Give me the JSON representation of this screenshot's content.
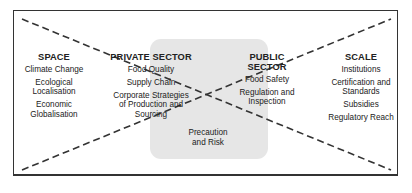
{
  "diagram": {
    "columns": [
      {
        "id": "space",
        "heading": "SPACE",
        "items": [
          "Climate Change",
          "Ecological Localisation",
          "Economic Globalisation"
        ]
      },
      {
        "id": "private-sector",
        "heading": "PRIVATE SECTOR",
        "items": [
          "Food Quality",
          "Supply Chain",
          "Corporate Strategies of Production and Sourcing"
        ]
      },
      {
        "id": "public-sector",
        "heading": "PUBLIC SECTOR",
        "items": [
          "Food Safety",
          "Regulation and Inspection"
        ]
      },
      {
        "id": "scale",
        "heading": "SCALE",
        "items": [
          "Institutions",
          "Certification and Standards",
          "Subsidies",
          "Regulatory Reach"
        ]
      }
    ],
    "center_label": "Precaution and Risk",
    "colors": {
      "border": "#333333",
      "shaded_area": "#e6e6e6",
      "text": "#222222",
      "dash": "#333333"
    }
  }
}
